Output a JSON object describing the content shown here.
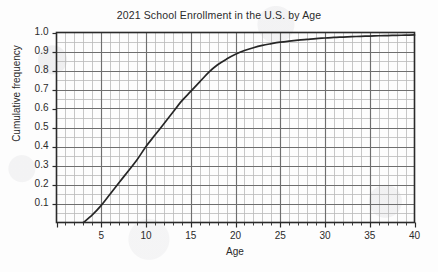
{
  "chart_data": {
    "type": "line",
    "title": "2021  School Enrollment in the U.S. by Age",
    "xlabel": "Age",
    "ylabel": "Cumulative frequency",
    "xlim": [
      0,
      40
    ],
    "ylim": [
      0,
      1.0
    ],
    "grid": "major and minor grid on, major every 5 on x and 0.1 on y, minor every 1 on x and 0.05 on y",
    "legend": "none",
    "x_tick_labels": [
      "5",
      "10",
      "15",
      "20",
      "25",
      "30",
      "35",
      "40"
    ],
    "x_tick_values": [
      5,
      10,
      15,
      20,
      25,
      30,
      35,
      40
    ],
    "y_tick_labels": [
      "0.1",
      "0.2",
      "0.3",
      "0.4",
      "0.5",
      "0.6",
      "0.7",
      "0.8",
      "0.9",
      "1.0"
    ],
    "y_tick_values": [
      0.1,
      0.2,
      0.3,
      0.4,
      0.5,
      0.6,
      0.7,
      0.8,
      0.9,
      1.0
    ],
    "series": [
      {
        "name": "Cumulative frequency of school enrollment by age",
        "x": [
          3,
          4,
          5,
          6,
          7,
          8,
          9,
          10,
          11,
          12,
          13,
          14,
          15,
          16,
          17,
          18,
          19,
          20,
          21,
          22,
          23,
          24,
          25,
          26,
          27,
          28,
          29,
          30,
          31,
          32,
          33,
          34,
          35,
          36,
          37,
          38,
          39,
          40
        ],
        "y": [
          0.0,
          0.04,
          0.09,
          0.15,
          0.21,
          0.27,
          0.33,
          0.4,
          0.46,
          0.52,
          0.58,
          0.64,
          0.69,
          0.74,
          0.79,
          0.83,
          0.86,
          0.885,
          0.905,
          0.92,
          0.932,
          0.941,
          0.949,
          0.955,
          0.96,
          0.964,
          0.968,
          0.971,
          0.974,
          0.976,
          0.978,
          0.98,
          0.981,
          0.983,
          0.984,
          0.985,
          0.986,
          0.987
        ]
      }
    ]
  },
  "axes": {
    "frame_color": "#2a2a2a",
    "major_grid_color": "#6e6e6e",
    "minor_grid_color": "#b9b9b9",
    "curve_color": "#262626"
  }
}
